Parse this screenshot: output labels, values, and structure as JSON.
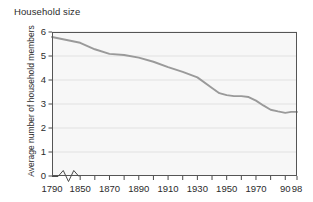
{
  "chart_data": {
    "type": "line",
    "title": "Household size",
    "xlabel": "",
    "ylabel": "Average number of household members",
    "ylim": [
      0,
      6
    ],
    "xlim": [
      1790,
      1998
    ],
    "grid": true,
    "legend": "none",
    "axis_break": {
      "present": true,
      "between": [
        1790,
        1850
      ],
      "style": "zigzag"
    },
    "ytick_labels": [
      "0",
      "1",
      "2",
      "3",
      "4",
      "5",
      "6"
    ],
    "ytick_values": [
      0,
      1,
      2,
      3,
      4,
      5,
      6
    ],
    "xtick_labels": [
      "1790",
      "1850",
      "1870",
      "1890",
      "1910",
      "1930",
      "1950",
      "1970",
      "90",
      "98"
    ],
    "xtick_values": [
      1790,
      1850,
      1870,
      1890,
      1910,
      1930,
      1950,
      1970,
      1990,
      1998
    ],
    "minor_xtick_values": [
      1860,
      1880,
      1900,
      1920,
      1940,
      1960,
      1980
    ],
    "series": [
      {
        "name": "Average household size",
        "x": [
          1790,
          1850,
          1860,
          1870,
          1880,
          1890,
          1900,
          1910,
          1920,
          1930,
          1940,
          1945,
          1950,
          1955,
          1960,
          1965,
          1970,
          1975,
          1980,
          1985,
          1990,
          1994,
          1998
        ],
        "values": [
          5.79,
          5.55,
          5.28,
          5.09,
          5.04,
          4.93,
          4.76,
          4.54,
          4.34,
          4.11,
          3.67,
          3.45,
          3.37,
          3.33,
          3.33,
          3.29,
          3.14,
          2.94,
          2.76,
          2.69,
          2.63,
          2.67,
          2.67
        ]
      }
    ],
    "line_color": "#9a9a9a",
    "plot_background": "#f7f7f7",
    "grid_color": "#dcdcdc",
    "frame_color": "#555555"
  }
}
